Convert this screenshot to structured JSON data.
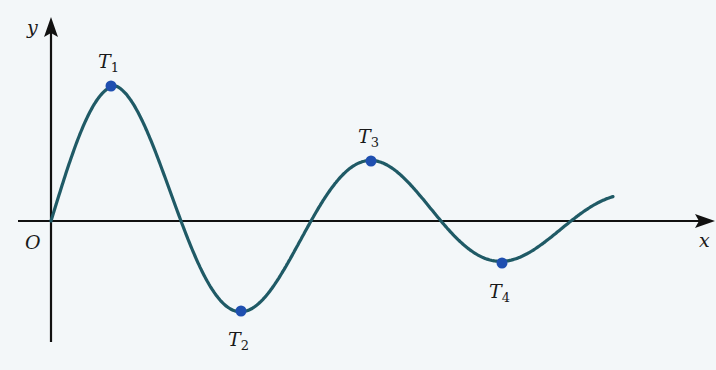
{
  "diagram": {
    "title": "",
    "axes": {
      "x_label": "x",
      "y_label": "y",
      "origin_label": "O"
    },
    "curve": {
      "description": "damped oscillation starting at origin",
      "color": "#1f5a66",
      "zero_crossings_px": [
        51,
        181,
        311,
        441,
        571
      ],
      "end_px": [
        613,
        197
      ]
    },
    "points": [
      {
        "name": "T",
        "sub": "1",
        "x": 111,
        "y": 86,
        "label_x": 98,
        "label_y": 52
      },
      {
        "name": "T",
        "sub": "2",
        "x": 241,
        "y": 311,
        "label_x": 228,
        "label_y": 330
      },
      {
        "name": "T",
        "sub": "3",
        "x": 371,
        "y": 161,
        "label_x": 358,
        "label_y": 127
      },
      {
        "name": "T",
        "sub": "4",
        "x": 502,
        "y": 263,
        "label_x": 489,
        "label_y": 282
      }
    ],
    "point_color": "#1f4fb0",
    "axis_color": "#111111"
  }
}
